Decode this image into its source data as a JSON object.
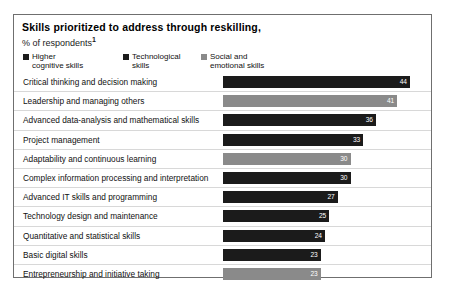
{
  "chart_data": {
    "type": "bar",
    "orientation": "horizontal",
    "title": "Skills prioritized to address through reskilling,",
    "subtitle": "% of respondents",
    "footnote_mark": "1",
    "xlabel": "",
    "ylabel": "",
    "xlim": [
      0,
      48
    ],
    "grid": false,
    "legend_position": "top-left",
    "legend": [
      {
        "label": "Higher\ncognitive skills",
        "color": "#1b1b1b",
        "key": "higher_cognitive"
      },
      {
        "label": "Technological\nskills",
        "color": "#1b1b1b",
        "key": "technological"
      },
      {
        "label": "Social and\nemotional skills",
        "color": "#8a8a8a",
        "key": "social_emotional"
      }
    ],
    "categories": [
      "Critical thinking and decision making",
      "Leadership and managing others",
      "Advanced data-analysis and mathematical skills",
      "Project management",
      "Adaptability and continuous learning",
      "Complex information processing and interpretation",
      "Advanced IT skills and programming",
      "Technology design and maintenance",
      "Quantitative and statistical skills",
      "Basic digital skills",
      "Entrepreneurship and initiative taking"
    ],
    "values": [
      44,
      41,
      36,
      33,
      30,
      30,
      27,
      25,
      24,
      23,
      23
    ],
    "series": [
      {
        "name": "Skills prioritized to address through reskilling",
        "values": [
          44,
          41,
          36,
          33,
          30,
          30,
          27,
          25,
          24,
          23,
          23
        ],
        "point_categories": [
          "higher_cognitive",
          "social_emotional",
          "technological",
          "higher_cognitive",
          "social_emotional",
          "higher_cognitive",
          "technological",
          "technological",
          "higher_cognitive",
          "technological",
          "social_emotional"
        ]
      }
    ],
    "bars": [
      {
        "label": "Critical thinking and decision making",
        "value": 44,
        "value_text": "44",
        "category": "higher_cognitive",
        "color": "#1b1b1b"
      },
      {
        "label": "Leadership and managing others",
        "value": 41,
        "value_text": "41",
        "category": "social_emotional",
        "color": "#8a8a8a"
      },
      {
        "label": "Advanced data-analysis and mathematical skills",
        "value": 36,
        "value_text": "36",
        "category": "technological",
        "color": "#1b1b1b"
      },
      {
        "label": "Project management",
        "value": 33,
        "value_text": "33",
        "category": "higher_cognitive",
        "color": "#1b1b1b"
      },
      {
        "label": "Adaptability and continuous learning",
        "value": 30,
        "value_text": "30",
        "category": "social_emotional",
        "color": "#8a8a8a"
      },
      {
        "label": "Complex information processing and interpretation",
        "value": 30,
        "value_text": "30",
        "category": "higher_cognitive",
        "color": "#1b1b1b"
      },
      {
        "label": "Advanced IT skills and programming",
        "value": 27,
        "value_text": "27",
        "category": "technological",
        "color": "#1b1b1b"
      },
      {
        "label": "Technology design and maintenance",
        "value": 25,
        "value_text": "25",
        "category": "technological",
        "color": "#1b1b1b"
      },
      {
        "label": "Quantitative and statistical skills",
        "value": 24,
        "value_text": "24",
        "category": "higher_cognitive",
        "color": "#1b1b1b"
      },
      {
        "label": "Basic digital skills",
        "value": 23,
        "value_text": "23",
        "category": "technological",
        "color": "#1b1b1b"
      },
      {
        "label": "Entrepreneurship and initiative taking",
        "value": 23,
        "value_text": "23",
        "category": "social_emotional",
        "color": "#8a8a8a"
      }
    ]
  },
  "colors": {
    "dark": "#1b1b1b",
    "light_gray": "#8a8a8a",
    "frame": "#6f6f6f",
    "row_rule": "#d8d8d8",
    "value_text": "#ffffff"
  }
}
